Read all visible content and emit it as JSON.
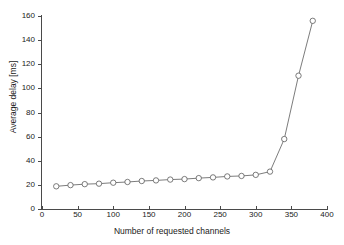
{
  "figure": {
    "background_color": "#ffffff",
    "axis_color": "#4a4a4a",
    "line_color": "#5a5a5a",
    "marker_edge_color": "#5a5a5a",
    "marker_face_color": "#ffffff"
  },
  "chart_data": {
    "type": "line",
    "title": "",
    "xlabel": "Number of requested channels",
    "ylabel": "Average delay [ms]",
    "xlim": [
      0,
      400
    ],
    "ylim": [
      0,
      160
    ],
    "xticks": [
      0,
      50,
      100,
      150,
      200,
      250,
      300,
      350,
      400
    ],
    "yticks": [
      0,
      20,
      40,
      60,
      80,
      100,
      120,
      140,
      160
    ],
    "xtick_labels": [
      "0",
      "50",
      "100",
      "150",
      "200",
      "250",
      "300",
      "350",
      "400"
    ],
    "ytick_labels": [
      "0",
      "20",
      "40",
      "60",
      "80",
      "100",
      "120",
      "140",
      "160"
    ],
    "grid": false,
    "legend": null,
    "marker": "circle-open",
    "x": [
      20,
      40,
      60,
      80,
      100,
      120,
      140,
      160,
      180,
      200,
      220,
      240,
      260,
      280,
      300,
      320,
      340,
      360,
      380
    ],
    "values": [
      18.8,
      19.8,
      20.6,
      21.0,
      21.8,
      22.4,
      23.2,
      23.7,
      24.4,
      24.8,
      25.6,
      26.2,
      27.0,
      27.4,
      28.3,
      31.0,
      58.0,
      110.5,
      156.0
    ],
    "series": [
      {
        "name": "Average delay",
        "x": [
          20,
          40,
          60,
          80,
          100,
          120,
          140,
          160,
          180,
          200,
          220,
          240,
          260,
          280,
          300,
          320,
          340,
          360,
          380
        ],
        "values": [
          18.8,
          19.8,
          20.6,
          21.0,
          21.8,
          22.4,
          23.2,
          23.7,
          24.4,
          24.8,
          25.6,
          26.2,
          27.0,
          27.4,
          28.3,
          31.0,
          58.0,
          110.5,
          156.0
        ]
      }
    ]
  }
}
